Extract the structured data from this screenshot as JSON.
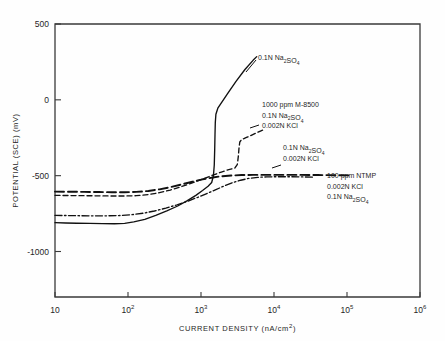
{
  "chart_data": {
    "type": "line",
    "title": "",
    "xlabel": "CURRENT DENSITY (nA/cm2)",
    "xlabel_parts": {
      "main": "CURRENT DENSITY (nA/cm",
      "sup": "2",
      "tail": ")"
    },
    "ylabel": "POTENTIAL (SCE) (mV)",
    "xscale": "log",
    "xlim": [
      10,
      1000000
    ],
    "ylim": [
      -1300,
      500
    ],
    "grid": false,
    "legend": "annotations-on-plot",
    "xticks": [
      10,
      100,
      1000,
      10000,
      100000,
      1000000
    ],
    "xtick_labels": [
      "10",
      "10^2",
      "10^3",
      "10^4",
      "10^5",
      "10^6"
    ],
    "xtick_label_parts": [
      {
        "base": "10",
        "exp": ""
      },
      {
        "base": "10",
        "exp": "2"
      },
      {
        "base": "10",
        "exp": "3"
      },
      {
        "base": "10",
        "exp": "4"
      },
      {
        "base": "10",
        "exp": "5"
      },
      {
        "base": "10",
        "exp": "6"
      }
    ],
    "yticks": [
      500,
      0,
      -500,
      -1000
    ],
    "ytick_labels": [
      "500",
      "0",
      "-500",
      "-1000"
    ],
    "series": [
      {
        "name": "0.1N Na2SO4",
        "style": "solid",
        "color": "#111111",
        "points": [
          [
            10,
            -810
          ],
          [
            14,
            -812
          ],
          [
            20,
            -814
          ],
          [
            30,
            -815
          ],
          [
            45,
            -816
          ],
          [
            65,
            -817
          ],
          [
            90,
            -815
          ],
          [
            120,
            -805
          ],
          [
            170,
            -788
          ],
          [
            240,
            -762
          ],
          [
            340,
            -732
          ],
          [
            480,
            -700
          ],
          [
            650,
            -665
          ],
          [
            850,
            -630
          ],
          [
            1050,
            -598
          ],
          [
            1250,
            -570
          ],
          [
            1400,
            -545
          ],
          [
            1480,
            -500
          ],
          [
            1520,
            -430
          ],
          [
            1540,
            -330
          ],
          [
            1555,
            -230
          ],
          [
            1570,
            -150
          ],
          [
            1600,
            -95
          ],
          [
            1700,
            -55
          ],
          [
            1900,
            -20
          ],
          [
            2300,
            40
          ],
          [
            3000,
            120
          ],
          [
            4000,
            200
          ],
          [
            5200,
            262
          ],
          [
            5800,
            285
          ]
        ]
      },
      {
        "name": "1000 ppm M-8500 / 0.1N Na2SO4 / 0.002N KCl",
        "style": "dashed",
        "color": "#111111",
        "points": [
          [
            10,
            -630
          ],
          [
            16,
            -631
          ],
          [
            25,
            -632
          ],
          [
            40,
            -633
          ],
          [
            60,
            -634
          ],
          [
            90,
            -634
          ],
          [
            130,
            -632
          ],
          [
            190,
            -625
          ],
          [
            270,
            -612
          ],
          [
            380,
            -595
          ],
          [
            540,
            -572
          ],
          [
            760,
            -548
          ],
          [
            1050,
            -522
          ],
          [
            1450,
            -497
          ],
          [
            1900,
            -476
          ],
          [
            2400,
            -460
          ],
          [
            2900,
            -450
          ],
          [
            3150,
            -425
          ],
          [
            3250,
            -370
          ],
          [
            3320,
            -315
          ],
          [
            3400,
            -278
          ],
          [
            3600,
            -262
          ],
          [
            4200,
            -248
          ],
          [
            5200,
            -228
          ],
          [
            6400,
            -208
          ],
          [
            7300,
            -196
          ]
        ]
      },
      {
        "name": "0.1N Na2SO4 / 0.002N KCl",
        "style": "dashdot",
        "color": "#111111",
        "points": [
          [
            10,
            -762
          ],
          [
            15,
            -763
          ],
          [
            22,
            -764
          ],
          [
            34,
            -765
          ],
          [
            50,
            -765
          ],
          [
            75,
            -763
          ],
          [
            110,
            -758
          ],
          [
            160,
            -748
          ],
          [
            230,
            -733
          ],
          [
            330,
            -714
          ],
          [
            470,
            -692
          ],
          [
            660,
            -668
          ],
          [
            900,
            -643
          ],
          [
            1200,
            -618
          ],
          [
            1600,
            -592
          ],
          [
            2100,
            -567
          ],
          [
            2700,
            -546
          ],
          [
            3500,
            -530
          ],
          [
            4500,
            -518
          ],
          [
            6000,
            -511
          ],
          [
            8000,
            -508
          ],
          [
            11000,
            -507
          ],
          [
            16000,
            -507
          ],
          [
            24000,
            -508
          ],
          [
            34000,
            -510
          ]
        ]
      },
      {
        "name": "100 ppm NTMP / 0.002N KCl / 0.1N Na2SO4",
        "style": "longdash",
        "color": "#111111",
        "points": [
          [
            10,
            -605
          ],
          [
            16,
            -606
          ],
          [
            25,
            -607
          ],
          [
            40,
            -608
          ],
          [
            60,
            -609
          ],
          [
            90,
            -609
          ],
          [
            130,
            -607
          ],
          [
            190,
            -601
          ],
          [
            270,
            -590
          ],
          [
            380,
            -576
          ],
          [
            540,
            -558
          ],
          [
            760,
            -540
          ],
          [
            1050,
            -524
          ],
          [
            1450,
            -512
          ],
          [
            1900,
            -504
          ],
          [
            2600,
            -499
          ],
          [
            3600,
            -496
          ],
          [
            5200,
            -495
          ],
          [
            8000,
            -495
          ],
          [
            13000,
            -495
          ],
          [
            22000,
            -495
          ],
          [
            40000,
            -496
          ],
          [
            70000,
            -497
          ],
          [
            110000,
            -498
          ]
        ]
      }
    ],
    "annotations": [
      {
        "id": "ann-na2so4",
        "lines": [
          {
            "text": "0.1N Na",
            "sub": "2",
            "text2": "SO",
            "sub2": "4"
          }
        ],
        "raw": "0.1N Na2SO4",
        "x": 258,
        "y": 60,
        "leader": {
          "x1": 246,
          "y1": 72,
          "x2": 256,
          "y2": 60
        }
      },
      {
        "id": "ann-m8500",
        "raw": "1000 ppm M-8500 / 0.1N Na2SO4 / 0.002N KCl",
        "lines": [
          "1000 ppm M-8500",
          "0.1N Na2SO4",
          "0.002N KCl"
        ],
        "x": 262,
        "y": 107,
        "leader": {
          "x1": 250,
          "y1": 128,
          "x2": 259,
          "y2": 125
        }
      },
      {
        "id": "ann-kcl",
        "raw": "0.1N Na2SO4 / 0.002N KCl",
        "lines": [
          "0.1N Na2SO4",
          "0.002N KCl"
        ],
        "x": 283,
        "y": 150,
        "leader": {
          "x1": 272,
          "y1": 168,
          "x2": 281,
          "y2": 165
        }
      },
      {
        "id": "ann-ntmp",
        "raw": "100 ppm NTMP / 0.002N KCl / 0.1N Na2SO4",
        "lines": [
          "100 ppm NTMP",
          "0.002N KCl",
          "0.1N Na2SO4"
        ],
        "x": 327,
        "y": 178,
        "leader": null
      }
    ]
  },
  "figure": {
    "background": "#fefefe",
    "axis_color": "#3a3a3a",
    "line_color": "#111111"
  }
}
